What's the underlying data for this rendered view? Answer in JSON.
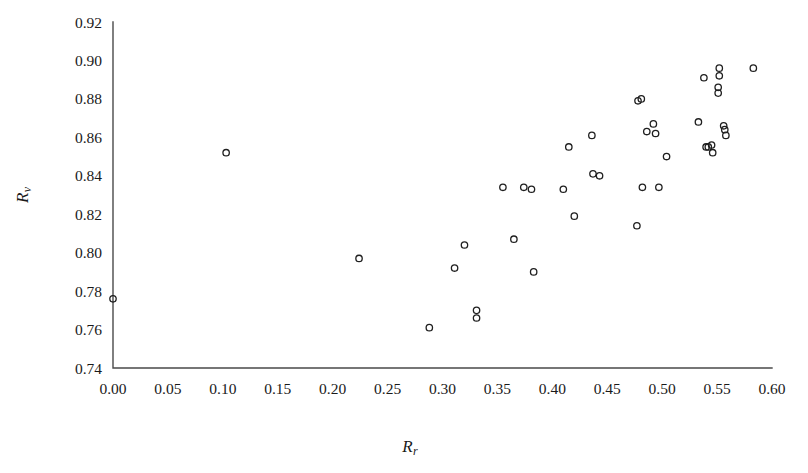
{
  "chart_data": {
    "type": "scatter",
    "title": "",
    "subtitle": "",
    "xlabel": "R_r",
    "ylabel": "R_v",
    "xlabel_base": "R",
    "xlabel_sub": "r",
    "ylabel_base": "R",
    "ylabel_sub": "v",
    "xlim": [
      0.0,
      0.6
    ],
    "ylim": [
      0.74,
      0.92
    ],
    "xticks": [
      0.0,
      0.05,
      0.1,
      0.15,
      0.2,
      0.25,
      0.3,
      0.35,
      0.4,
      0.45,
      0.5,
      0.55,
      0.6
    ],
    "yticks": [
      0.74,
      0.76,
      0.78,
      0.8,
      0.82,
      0.84,
      0.86,
      0.88,
      0.9,
      0.92
    ],
    "xtick_labels": [
      "0.00",
      "0.05",
      "0.10",
      "0.15",
      "0.20",
      "0.25",
      "0.30",
      "0.35",
      "0.40",
      "0.45",
      "0.50",
      "0.55",
      "0.60"
    ],
    "ytick_labels": [
      "0.74",
      "0.76",
      "0.78",
      "0.80",
      "0.82",
      "0.84",
      "0.86",
      "0.88",
      "0.90",
      "0.92"
    ],
    "grid": false,
    "legend": "none",
    "marker_style": "open-circle",
    "marker_color": "#1f1f1f",
    "marker_radius": 3.2,
    "series": [
      {
        "name": "samples",
        "points": [
          [
            0.0,
            0.776
          ],
          [
            0.103,
            0.852
          ],
          [
            0.224,
            0.797
          ],
          [
            0.288,
            0.761
          ],
          [
            0.311,
            0.792
          ],
          [
            0.32,
            0.804
          ],
          [
            0.331,
            0.77
          ],
          [
            0.331,
            0.766
          ],
          [
            0.355,
            0.834
          ],
          [
            0.365,
            0.807
          ],
          [
            0.374,
            0.834
          ],
          [
            0.381,
            0.833
          ],
          [
            0.383,
            0.79
          ],
          [
            0.41,
            0.833
          ],
          [
            0.415,
            0.855
          ],
          [
            0.42,
            0.819
          ],
          [
            0.436,
            0.861
          ],
          [
            0.437,
            0.841
          ],
          [
            0.443,
            0.84
          ],
          [
            0.477,
            0.814
          ],
          [
            0.478,
            0.879
          ],
          [
            0.481,
            0.88
          ],
          [
            0.482,
            0.834
          ],
          [
            0.486,
            0.863
          ],
          [
            0.492,
            0.867
          ],
          [
            0.494,
            0.862
          ],
          [
            0.497,
            0.834
          ],
          [
            0.504,
            0.85
          ],
          [
            0.533,
            0.868
          ],
          [
            0.538,
            0.891
          ],
          [
            0.54,
            0.855
          ],
          [
            0.542,
            0.855
          ],
          [
            0.545,
            0.856
          ],
          [
            0.546,
            0.852
          ],
          [
            0.551,
            0.886
          ],
          [
            0.551,
            0.883
          ],
          [
            0.552,
            0.896
          ],
          [
            0.552,
            0.892
          ],
          [
            0.556,
            0.866
          ],
          [
            0.557,
            0.864
          ],
          [
            0.558,
            0.861
          ],
          [
            0.583,
            0.896
          ]
        ]
      }
    ]
  }
}
